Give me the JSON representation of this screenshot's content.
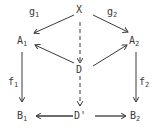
{
  "diagram": {
    "type": "commutative-diagram",
    "nodes": {
      "X": {
        "base": "X",
        "sub": "",
        "x": 79,
        "y": 14
      },
      "A1": {
        "base": "A",
        "sub": "1",
        "x": 22,
        "y": 40
      },
      "A2": {
        "base": "A",
        "sub": "2",
        "x": 136,
        "y": 40
      },
      "D": {
        "base": "D",
        "sub": "",
        "x": 79,
        "y": 70
      },
      "B1": {
        "base": "B",
        "sub": "1",
        "x": 22,
        "y": 116
      },
      "Dp": {
        "base": "D'",
        "sub": "",
        "x": 79,
        "y": 116
      },
      "B2": {
        "base": "B",
        "sub": "2",
        "x": 136,
        "y": 116
      }
    },
    "edge_labels": {
      "g1": {
        "base": "g",
        "sub": "1"
      },
      "g2": {
        "base": "g",
        "sub": "2"
      },
      "f1": {
        "base": "f",
        "sub": "1"
      },
      "f2": {
        "base": "f",
        "sub": "2"
      }
    },
    "edges": [
      {
        "from": "X",
        "to": "A1",
        "label": "g1",
        "style": "solid"
      },
      {
        "from": "X",
        "to": "A2",
        "label": "g2",
        "style": "solid"
      },
      {
        "from": "X",
        "to": "D",
        "label": "",
        "style": "dashed"
      },
      {
        "from": "D",
        "to": "A1",
        "label": "",
        "style": "solid"
      },
      {
        "from": "D",
        "to": "A2",
        "label": "",
        "style": "solid"
      },
      {
        "from": "D",
        "to": "Dp",
        "label": "",
        "style": "dashed"
      },
      {
        "from": "A1",
        "to": "B1",
        "label": "f1",
        "style": "solid"
      },
      {
        "from": "A2",
        "to": "B2",
        "label": "f2",
        "style": "solid"
      },
      {
        "from": "Dp",
        "to": "B1",
        "label": "",
        "style": "solid"
      },
      {
        "from": "Dp",
        "to": "B2",
        "label": "",
        "style": "solid"
      }
    ],
    "colors": {
      "ink": "#3a3a3a",
      "background": "#ffffff"
    }
  }
}
